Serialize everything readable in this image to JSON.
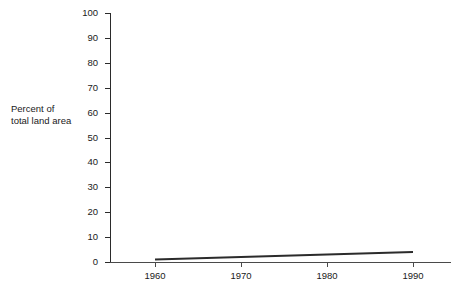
{
  "chart_data": {
    "type": "line",
    "title": "",
    "xlabel": "",
    "ylabel": "Percent of\ntotal land area",
    "ylabel_line1": "Percent of",
    "ylabel_line2": "total land area",
    "x": [
      1960,
      1970,
      1980,
      1990
    ],
    "xtick_labels": [
      "1960",
      "1970",
      "1980",
      "1990"
    ],
    "ytick_labels": [
      "100",
      "90",
      "80",
      "70",
      "60",
      "50",
      "40",
      "30",
      "20",
      "10",
      "0"
    ],
    "ytick_values": [
      100,
      90,
      80,
      70,
      60,
      50,
      40,
      30,
      20,
      10,
      0
    ],
    "xlim": [
      1960,
      1990
    ],
    "ylim": [
      0,
      100
    ],
    "grid": false,
    "legend": false,
    "series": [
      {
        "name": "Percent of total land area",
        "color": "#2b2b2b",
        "values": [
          1.0,
          2.0,
          3.0,
          4.0
        ]
      }
    ]
  },
  "axes": {
    "y_axis_color": "#2b2b2b",
    "x_axis_color": "#4a4a4a",
    "tick_color": "#2b2b2b"
  },
  "canvas": {
    "background": "#ffffff",
    "text_color": "#1a1a1a"
  }
}
